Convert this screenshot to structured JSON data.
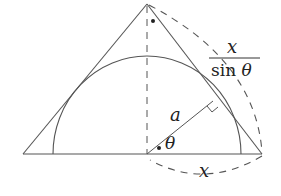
{
  "diagram": {
    "type": "geometry",
    "colors": {
      "stroke": "#555555",
      "text": "#222222",
      "background": "#ffffff"
    },
    "labels": {
      "fraction_numerator": "x",
      "fraction_denominator_func": "sin",
      "fraction_denominator_var": "θ",
      "radius": "a",
      "angle": "θ",
      "base_half": "x"
    },
    "points": {
      "apex": [
        147,
        4
      ],
      "left_base": [
        23,
        154
      ],
      "right_base": [
        262,
        154
      ],
      "center": [
        147,
        154
      ],
      "tangent_point": [
        213,
        101
      ]
    },
    "semicircle": {
      "center": [
        147,
        154
      ],
      "rx": 94,
      "ry": 98
    }
  }
}
